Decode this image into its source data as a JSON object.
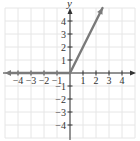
{
  "chart_data": {
    "type": "line",
    "title": "",
    "xlabel": "",
    "ylabel": "y",
    "xlim": [
      -5,
      5
    ],
    "ylim": [
      -5,
      5
    ],
    "grid": true,
    "x_ticks": [
      -4,
      -3,
      -2,
      -1,
      1,
      2,
      3,
      4
    ],
    "y_ticks": [
      -4,
      -3,
      -2,
      -1,
      1,
      2,
      3,
      4
    ],
    "x_tick_labels": [
      "−4",
      "−3",
      "−2",
      "−1",
      "1",
      "2",
      "3",
      "4"
    ],
    "y_tick_labels": [
      "−4",
      "−3",
      "−2",
      "−1",
      "1",
      "2",
      "3",
      "4"
    ],
    "series": [
      {
        "name": "piece-left",
        "description": "y = 0 for x < 0 (ray extending left)",
        "x": [
          -5,
          0
        ],
        "y": [
          0,
          0
        ],
        "arrow_end": "left"
      },
      {
        "name": "piece-right",
        "description": "y = 2x for x >= 0 (ray extending up-right)",
        "x": [
          0,
          2.5
        ],
        "y": [
          0,
          5
        ],
        "arrow_end": "right"
      }
    ],
    "legend": null
  },
  "axes": {
    "y_label": "y"
  },
  "colors": {
    "curve": "#7a7a7a",
    "axis": "#333333",
    "grid": "#e6e6e6"
  }
}
